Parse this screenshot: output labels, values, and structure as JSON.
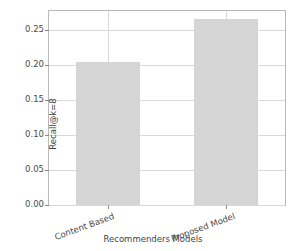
{
  "chart_data": {
    "type": "bar",
    "title": "",
    "xlabel": "Recommenders Models",
    "ylabel": "Recall@k=8",
    "categories": [
      "Content Based",
      "Proposed Model"
    ],
    "values": [
      0.205,
      0.266
    ],
    "series": [
      {
        "name": "Recall@k=8",
        "values": [
          0.205,
          0.266
        ]
      }
    ],
    "ylim": [
      0.0,
      0.2772
    ],
    "xlim": [
      -0.5,
      1.5
    ],
    "yticks": [
      0.0,
      0.05,
      0.1,
      0.15,
      0.2,
      0.25
    ],
    "ytick_labels": [
      "0.00",
      "0.05",
      "0.10",
      "0.15",
      "0.20",
      "0.25"
    ],
    "xtick_labels": [
      "Content Based",
      "Proposed Model"
    ],
    "xtick_rotation": -20,
    "grid": true,
    "grid_axis": "both",
    "legend": false,
    "legend_position": "none",
    "bar_color": "#d5d5d5",
    "grid_color": "#d9d9d9",
    "axis_color": "#b9b9b9",
    "text_color": "#4a4a4a",
    "background": "#ffffff",
    "bar_width_fraction": 0.55
  }
}
